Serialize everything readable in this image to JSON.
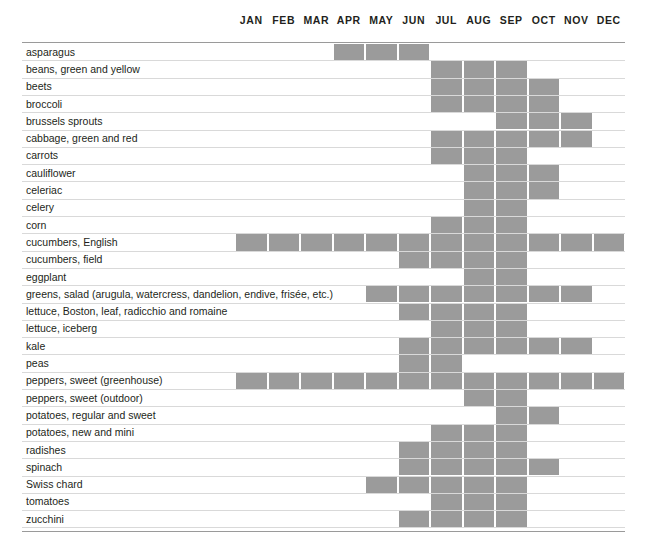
{
  "months": [
    "JAN",
    "FEB",
    "MAR",
    "APR",
    "MAY",
    "JUN",
    "JUL",
    "AUG",
    "SEP",
    "OCT",
    "NOV",
    "DEC"
  ],
  "colors": {
    "bar_fill": "#9b9b9b",
    "row_line": "#d9d9d9",
    "border_line": "#9a9a9a",
    "text": "#231f20",
    "background": "#ffffff"
  },
  "chart_data": {
    "type": "heatmap",
    "xlabel": "",
    "ylabel": "",
    "categories": [
      "JAN",
      "FEB",
      "MAR",
      "APR",
      "MAY",
      "JUN",
      "JUL",
      "AUG",
      "SEP",
      "OCT",
      "NOV",
      "DEC"
    ],
    "legend": [],
    "grid": false,
    "rows": [
      {
        "label": "asparagus",
        "months": [
          0,
          0,
          0,
          1,
          1,
          1,
          0,
          0,
          0,
          0,
          0,
          0
        ]
      },
      {
        "label": "beans, green and yellow",
        "months": [
          0,
          0,
          0,
          0,
          0,
          0,
          1,
          1,
          1,
          0,
          0,
          0
        ]
      },
      {
        "label": "beets",
        "months": [
          0,
          0,
          0,
          0,
          0,
          0,
          1,
          1,
          1,
          1,
          0,
          0
        ]
      },
      {
        "label": "broccoli",
        "months": [
          0,
          0,
          0,
          0,
          0,
          0,
          1,
          1,
          1,
          1,
          0,
          0
        ]
      },
      {
        "label": "brussels sprouts",
        "months": [
          0,
          0,
          0,
          0,
          0,
          0,
          0,
          0,
          1,
          1,
          1,
          0
        ]
      },
      {
        "label": "cabbage, green and red",
        "months": [
          0,
          0,
          0,
          0,
          0,
          0,
          1,
          1,
          1,
          1,
          1,
          0
        ]
      },
      {
        "label": "carrots",
        "months": [
          0,
          0,
          0,
          0,
          0,
          0,
          1,
          1,
          1,
          0,
          0,
          0
        ]
      },
      {
        "label": "cauliflower",
        "months": [
          0,
          0,
          0,
          0,
          0,
          0,
          0,
          1,
          1,
          1,
          0,
          0
        ]
      },
      {
        "label": "celeriac",
        "months": [
          0,
          0,
          0,
          0,
          0,
          0,
          0,
          1,
          1,
          1,
          0,
          0
        ]
      },
      {
        "label": "celery",
        "months": [
          0,
          0,
          0,
          0,
          0,
          0,
          0,
          1,
          1,
          0,
          0,
          0
        ]
      },
      {
        "label": "corn",
        "months": [
          0,
          0,
          0,
          0,
          0,
          0,
          1,
          1,
          1,
          0,
          0,
          0
        ]
      },
      {
        "label": "cucumbers, English",
        "months": [
          1,
          1,
          1,
          1,
          1,
          1,
          1,
          1,
          1,
          1,
          1,
          1
        ]
      },
      {
        "label": "cucumbers, field",
        "months": [
          0,
          0,
          0,
          0,
          0,
          1,
          1,
          1,
          1,
          0,
          0,
          0
        ]
      },
      {
        "label": "eggplant",
        "months": [
          0,
          0,
          0,
          0,
          0,
          0,
          0,
          1,
          1,
          0,
          0,
          0
        ]
      },
      {
        "label": "greens, salad (arugula, watercress, dandelion, endive, frisée, etc.)",
        "months": [
          0,
          0,
          0,
          0,
          1,
          1,
          1,
          1,
          1,
          1,
          1,
          0
        ]
      },
      {
        "label": "lettuce, Boston, leaf, radicchio and romaine",
        "months": [
          0,
          0,
          0,
          0,
          0,
          1,
          1,
          1,
          1,
          0,
          0,
          0
        ]
      },
      {
        "label": "lettuce, iceberg",
        "months": [
          0,
          0,
          0,
          0,
          0,
          0,
          1,
          1,
          1,
          0,
          0,
          0
        ]
      },
      {
        "label": "kale",
        "months": [
          0,
          0,
          0,
          0,
          0,
          1,
          1,
          1,
          1,
          1,
          1,
          0
        ]
      },
      {
        "label": "peas",
        "months": [
          0,
          0,
          0,
          0,
          0,
          1,
          1,
          0,
          0,
          0,
          0,
          0
        ]
      },
      {
        "label": "peppers, sweet (greenhouse)",
        "months": [
          1,
          1,
          1,
          1,
          1,
          1,
          1,
          1,
          1,
          1,
          1,
          1
        ]
      },
      {
        "label": "peppers, sweet (outdoor)",
        "months": [
          0,
          0,
          0,
          0,
          0,
          0,
          0,
          1,
          1,
          0,
          0,
          0
        ]
      },
      {
        "label": "potatoes, regular and sweet",
        "months": [
          0,
          0,
          0,
          0,
          0,
          0,
          0,
          0,
          1,
          1,
          0,
          0
        ]
      },
      {
        "label": "potatoes, new and mini",
        "months": [
          0,
          0,
          0,
          0,
          0,
          0,
          1,
          1,
          1,
          0,
          0,
          0
        ]
      },
      {
        "label": "radishes",
        "months": [
          0,
          0,
          0,
          0,
          0,
          1,
          1,
          1,
          1,
          0,
          0,
          0
        ]
      },
      {
        "label": "spinach",
        "months": [
          0,
          0,
          0,
          0,
          0,
          1,
          1,
          1,
          1,
          1,
          0,
          0
        ]
      },
      {
        "label": "Swiss chard",
        "months": [
          0,
          0,
          0,
          0,
          1,
          1,
          1,
          1,
          1,
          0,
          0,
          0
        ]
      },
      {
        "label": "tomatoes",
        "months": [
          0,
          0,
          0,
          0,
          0,
          0,
          1,
          1,
          1,
          0,
          0,
          0
        ]
      },
      {
        "label": "zucchini",
        "months": [
          0,
          0,
          0,
          0,
          0,
          1,
          1,
          1,
          1,
          0,
          0,
          0
        ]
      }
    ]
  },
  "layout": {
    "grid_left": 235,
    "grid_right": 625,
    "header_baseline": 36,
    "first_row_top": 44,
    "row_height": 17.3
  }
}
